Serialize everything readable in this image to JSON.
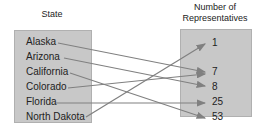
{
  "headings": {
    "left": "State",
    "right_line1": "Number of",
    "right_line2": "Representatives"
  },
  "domain_items": [
    "Alaska",
    "Arizona",
    "California",
    "Colorado",
    "Florida",
    "North Dakota"
  ],
  "range_items": [
    "1",
    "7",
    "8",
    "25",
    "53"
  ],
  "mappings": [
    {
      "from": "Alaska",
      "to": "7"
    },
    {
      "from": "Arizona",
      "to": "8"
    },
    {
      "from": "California",
      "to": "53"
    },
    {
      "from": "Colorado",
      "to": "7"
    },
    {
      "from": "Florida",
      "to": "25"
    },
    {
      "from": "North Dakota",
      "to": "1"
    }
  ],
  "colors": {
    "box": "#c8c8c8",
    "arrow": "#808080",
    "text": "#222222"
  }
}
